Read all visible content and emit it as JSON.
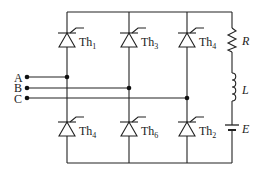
{
  "diagram": {
    "inputs": [
      {
        "label": "A",
        "y": 77,
        "joint_x": 67
      },
      {
        "label": "B",
        "y": 88,
        "joint_x": 129
      },
      {
        "label": "C",
        "y": 98,
        "joint_x": 187
      }
    ],
    "thyristors_top": [
      {
        "name": "Th",
        "sub": "1",
        "x": 67
      },
      {
        "name": "Th",
        "sub": "3",
        "x": 129
      },
      {
        "name": "Th",
        "sub": "4",
        "x": 187
      }
    ],
    "thyristors_bottom": [
      {
        "name": "Th",
        "sub": "4",
        "x": 67
      },
      {
        "name": "Th",
        "sub": "6",
        "x": 129
      },
      {
        "name": "Th",
        "sub": "2",
        "x": 187
      }
    ],
    "load": {
      "resistor": "R",
      "inductor": "L",
      "source": "E"
    }
  }
}
